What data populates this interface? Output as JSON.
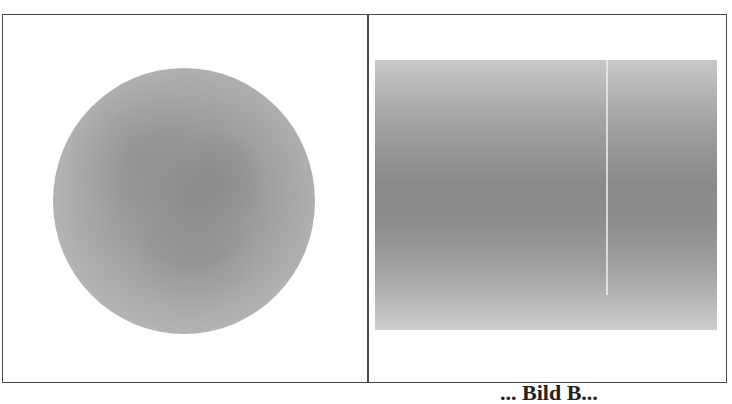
{
  "figure": {
    "panels": [
      {
        "name": "left-panel",
        "content": "circular gray gradient image (disk with darker center)"
      },
      {
        "name": "right-panel",
        "content": "rectangular gray gradient image (dark horizontal band in middle, light thin vertical line)"
      }
    ],
    "colors": {
      "frame": "#4a4a4a",
      "disk_center": "#8f8f8f",
      "disk_edge": "#c6c6c6",
      "rect_dark": "#8a8a8a",
      "rect_light": "#cdcdcd",
      "background": "#ffffff"
    },
    "caption_fragment": "... Bild B..."
  }
}
